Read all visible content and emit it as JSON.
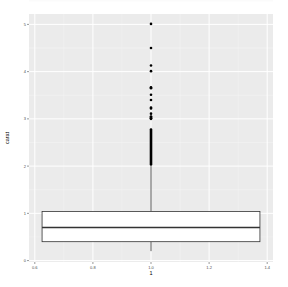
{
  "chart_data": {
    "type": "boxplot",
    "title": "",
    "xlabel": "1",
    "ylabel": "carat",
    "x_ticks": [
      "0.6",
      "0.8",
      "1.0",
      "1.2",
      "1.4"
    ],
    "x_tick_values": [
      0.6,
      0.8,
      1.0,
      1.2,
      1.4
    ],
    "y_ticks": [
      "0",
      "1",
      "2",
      "3",
      "4",
      "5"
    ],
    "y_tick_values": [
      0,
      1,
      2,
      3,
      4,
      5
    ],
    "xlim": [
      0.58,
      1.42
    ],
    "ylim": [
      -0.03,
      5.22
    ],
    "grid": true,
    "legend": "none",
    "box": {
      "x": 1.0,
      "width": 0.75,
      "lower_whisker": 0.2,
      "q1": 0.4,
      "median": 0.7,
      "q3": 1.04,
      "upper_whisker": 2.0
    },
    "outliers": [
      5.01,
      4.5,
      4.13,
      4.01,
      3.67,
      3.65,
      3.51,
      3.4,
      3.24,
      3.22,
      3.11,
      3.05,
      3.04,
      3.02,
      3.01,
      3.0
    ],
    "outlier_dense_range": [
      2.01,
      2.8
    ]
  },
  "colors": {
    "panel_background": "#EBEBEB",
    "grid_major": "#FFFFFF",
    "grid_minor": "#F5F5F5",
    "box_fill": "#FFFFFF",
    "box_stroke": "#333333",
    "outlier": "#000000",
    "tick_label": "#4D4D4D",
    "tick_mark": "#333333"
  }
}
